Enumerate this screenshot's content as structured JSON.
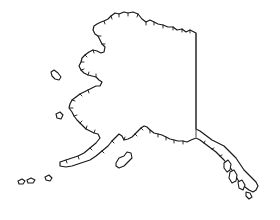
{
  "map": {
    "subject": "Alaska",
    "style": "outline line drawing",
    "stroke_color": "#1a1a1a",
    "border_color": "#444444",
    "background": "#ffffff",
    "features": [
      {
        "name": "mainland",
        "type": "landmass"
      },
      {
        "name": "canada-border",
        "type": "boundary-line"
      },
      {
        "name": "aleutian-islands",
        "type": "island-chain"
      },
      {
        "name": "kodiak-island",
        "type": "island"
      },
      {
        "name": "st-lawrence-island",
        "type": "island"
      },
      {
        "name": "nunivak-island",
        "type": "island"
      },
      {
        "name": "southeast-panhandle",
        "type": "landmass"
      }
    ]
  }
}
